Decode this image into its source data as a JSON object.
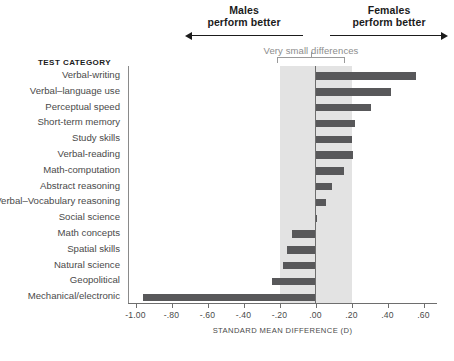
{
  "header": {
    "males": {
      "title": "Males",
      "subtitle": "perform better",
      "arrow": "arrow-left"
    },
    "females": {
      "title": "Females",
      "subtitle": "perform better",
      "arrow": "arrow-right"
    }
  },
  "annotation": {
    "very_small_differences": "Very small differences",
    "band_range": [
      -0.2,
      0.2
    ],
    "band_color": "#e3e3e3"
  },
  "labels": {
    "test_category_header": "TEST CATEGORY"
  },
  "chart_data": {
    "type": "bar",
    "orientation": "horizontal",
    "title": "",
    "xlabel": "STANDARD MEAN DIFFERENCE (D)",
    "ylabel": "TEST CATEGORY",
    "xlim": [
      -1.0,
      0.6
    ],
    "xticks": [
      -1.0,
      -0.8,
      -0.6,
      -0.4,
      -0.2,
      0.0,
      0.2,
      0.4,
      0.6
    ],
    "xticklabels": [
      "-1.00",
      "-.80",
      "-.60",
      "-.40",
      "-.20",
      ".00",
      ".20",
      ".40",
      ".60"
    ],
    "grid": false,
    "legend": null,
    "bar_color": "#58585a",
    "categories": [
      "Verbal-writing",
      "Verbal–language use",
      "Perceptual speed",
      "Short-term memory",
      "Study skills",
      "Verbal-reading",
      "Math-computation",
      "Abstract reasoning",
      "Verbal–Vocabulary reasoning",
      "Social science",
      "Math concepts",
      "Spatial skills",
      "Natural science",
      "Geopolitical",
      "Mechanical/electronic"
    ],
    "values": [
      0.56,
      0.42,
      0.31,
      0.22,
      0.2,
      0.21,
      0.16,
      0.09,
      0.06,
      0.01,
      -0.13,
      -0.16,
      -0.18,
      -0.24,
      -0.96
    ]
  }
}
